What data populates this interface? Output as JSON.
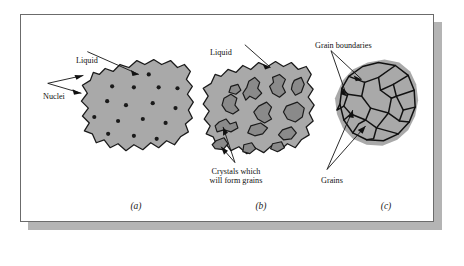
{
  "figure": {
    "background_color": "#ffffff",
    "frame_border_color": "#6b6b6b",
    "frame_shadow_color": "#b4b4b4",
    "blob_fill_color": "#a9a9a9",
    "blob_outline_color": "#1a1a1a",
    "crystal_fill_color": "#8a8a8a",
    "nuclei_color": "#1a1a1a",
    "grain_boundary_color": "#111111",
    "leader_line_color": "#111111"
  },
  "panels": [
    {
      "caption": "(a)",
      "stage": "nucleation",
      "labels": [
        {
          "name": "liquid",
          "text": "Liquid"
        },
        {
          "name": "nuclei",
          "text": "Nuclei"
        }
      ],
      "nuclei_count": 16
    },
    {
      "caption": "(b)",
      "stage": "crystal-growth",
      "labels": [
        {
          "name": "liquid",
          "text": "Liquid"
        },
        {
          "name": "crystals",
          "text": "Crystals which will form grains"
        }
      ],
      "crystal_count": 13
    },
    {
      "caption": "(c)",
      "stage": "grain-structure",
      "labels": [
        {
          "name": "grain-boundaries",
          "text": "Grain boundaries"
        },
        {
          "name": "grains",
          "text": "Grains"
        }
      ],
      "grain_count": 16
    }
  ],
  "captions": {
    "a": "(a)",
    "b": "(b)",
    "c": "(c)"
  },
  "text": {
    "liquid_a": "Liquid",
    "nuclei": "Nuclei",
    "liquid_b": "Liquid",
    "crystals_line1": "Crystals which",
    "crystals_line2": "will form grains",
    "grain_boundaries": "Grain boundaries",
    "grains": "Grains"
  }
}
